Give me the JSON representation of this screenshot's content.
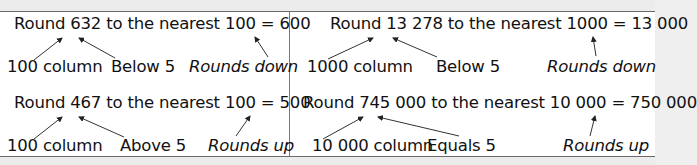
{
  "examples": [
    {
      "equation": "Round 632 to the nearest 100 = 600",
      "labels": {
        "column": "100 column",
        "digit_rule": "Below 5",
        "result": "Rounds down"
      }
    },
    {
      "equation": "Round 13 278 to the nearest 1000 = 13 000",
      "labels": {
        "column": "1000 column",
        "digit_rule": "Below 5",
        "result": "Rounds down"
      }
    },
    {
      "equation": "Round 467 to the nearest 100 = 500",
      "labels": {
        "column": "100 column",
        "digit_rule": "Above 5",
        "result": "Rounds up"
      }
    },
    {
      "equation": "Round 745 000 to the nearest 10 000 = 750 000",
      "labels": {
        "column": "10 000 column",
        "digit_rule": "Equals 5",
        "result": "Rounds up"
      }
    }
  ],
  "colors": {
    "border": "#6a6a6a",
    "text": "#111111",
    "background": "#ffffff",
    "band": "#ececec"
  }
}
